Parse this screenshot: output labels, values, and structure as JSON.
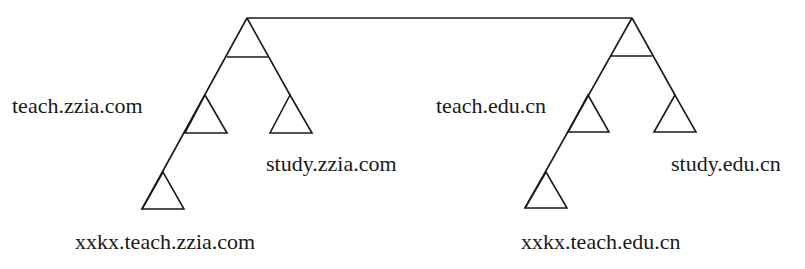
{
  "diagram": {
    "type": "domain-name-tree",
    "colors": {
      "stroke": "#1a1a1a",
      "background": "#ffffff"
    },
    "trees": [
      {
        "name": "zzia",
        "labels": {
          "teach": "teach.zzia.com",
          "study": "study.zzia.com",
          "xxkx": "xxkx.teach.zzia.com"
        }
      },
      {
        "name": "edu",
        "labels": {
          "teach": "teach.edu.cn",
          "study": "study.edu.cn",
          "xxkx": "xxkx.teach.edu.cn"
        }
      }
    ]
  }
}
